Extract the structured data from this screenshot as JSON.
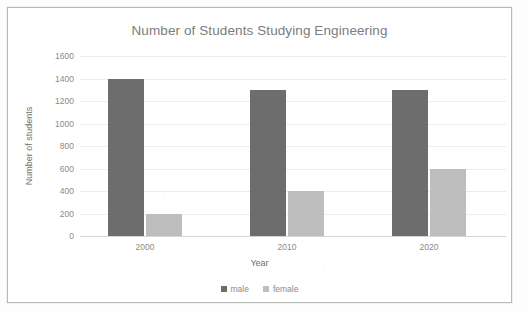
{
  "chart_data": {
    "type": "bar",
    "title": "Number of Students Studying Engineering",
    "xlabel": "Year",
    "ylabel": "Number of students",
    "categories": [
      "2000",
      "2010",
      "2020"
    ],
    "series": [
      {
        "name": "male",
        "values": [
          1400,
          1300,
          1300
        ],
        "color": "#6d6d6d"
      },
      {
        "name": "female",
        "values": [
          200,
          400,
          600
        ],
        "color": "#bebebe"
      }
    ],
    "ylim": [
      0,
      1600
    ],
    "yticks": [
      1600,
      1400,
      1200,
      1000,
      800,
      600,
      400,
      200,
      0
    ],
    "grid": true,
    "legend_position": "bottom"
  },
  "legend": {
    "items": [
      {
        "label": "male",
        "color": "#6d6d6d"
      },
      {
        "label": "female",
        "color": "#bebebe"
      }
    ]
  }
}
